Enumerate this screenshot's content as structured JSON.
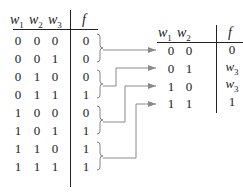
{
  "left_table": {
    "headers": {
      "w1": "w",
      "w1_sub": "1",
      "w2": "w",
      "w2_sub": "2",
      "w3": "w",
      "w3_sub": "3",
      "f": "f"
    },
    "rows": [
      {
        "w1": "0",
        "w2": "0",
        "w3": "0",
        "f": "0"
      },
      {
        "w1": "0",
        "w2": "0",
        "w3": "1",
        "f": "0"
      },
      {
        "w1": "0",
        "w2": "1",
        "w3": "0",
        "f": "0"
      },
      {
        "w1": "0",
        "w2": "1",
        "w3": "1",
        "f": "1"
      },
      {
        "w1": "1",
        "w2": "0",
        "w3": "0",
        "f": "0"
      },
      {
        "w1": "1",
        "w2": "0",
        "w3": "1",
        "f": "1"
      },
      {
        "w1": "1",
        "w2": "1",
        "w3": "0",
        "f": "1"
      },
      {
        "w1": "1",
        "w2": "1",
        "w3": "1",
        "f": "1"
      }
    ]
  },
  "right_table": {
    "headers": {
      "w1": "w",
      "w1_sub": "1",
      "w2": "w",
      "w2_sub": "2",
      "f": "f"
    },
    "rows": [
      {
        "w1": "0",
        "w2": "0",
        "f": "0",
        "f_sub": ""
      },
      {
        "w1": "0",
        "w2": "1",
        "f": "w",
        "f_sub": "3"
      },
      {
        "w1": "1",
        "w2": "0",
        "f": "w",
        "f_sub": "3"
      },
      {
        "w1": "1",
        "w2": "1",
        "f": "1",
        "f_sub": ""
      }
    ]
  },
  "colors": {
    "text": "#222222",
    "rule": "#222222",
    "connector": "#888888"
  }
}
